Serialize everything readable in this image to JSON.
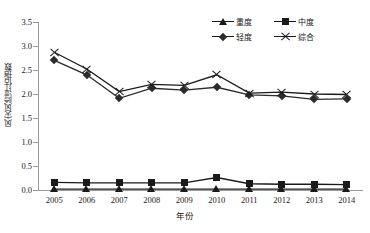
{
  "chart_data": {
    "type": "line",
    "title": "",
    "xlabel": "年份",
    "ylabel": "风灾风险评估指数",
    "categories": [
      "2005",
      "2006",
      "2007",
      "2008",
      "2009",
      "2010",
      "2011",
      "2012",
      "2013",
      "2014"
    ],
    "ylim": [
      0.0,
      3.5
    ],
    "ytick_labels": [
      "0.0",
      "0.5",
      "1.0",
      "1.5",
      "2.0",
      "2.5",
      "3.0",
      "3.5"
    ],
    "ytick_values": [
      0.0,
      0.5,
      1.0,
      1.5,
      2.0,
      2.5,
      3.0,
      3.5
    ],
    "grid": false,
    "legend_position": "top-right",
    "series": [
      {
        "name": "重度",
        "marker": "triangle",
        "color": "#1a1a1a",
        "values": [
          0.02,
          0.02,
          0.02,
          0.02,
          0.02,
          0.02,
          0.02,
          0.02,
          0.02,
          0.02
        ]
      },
      {
        "name": "中度",
        "marker": "square",
        "color": "#1a1a1a",
        "values": [
          0.16,
          0.15,
          0.15,
          0.15,
          0.15,
          0.26,
          0.13,
          0.12,
          0.12,
          0.11
        ]
      },
      {
        "name": "轻度",
        "marker": "diamond",
        "color": "#2b2b2b",
        "values": [
          2.7,
          2.4,
          1.91,
          2.12,
          2.08,
          2.14,
          1.98,
          1.96,
          1.89,
          1.9
        ]
      },
      {
        "name": "综合",
        "marker": "cross",
        "color": "#1a1a1a",
        "values": [
          2.87,
          2.52,
          2.05,
          2.2,
          2.18,
          2.4,
          2.02,
          2.04,
          2.0,
          1.99
        ]
      }
    ]
  },
  "legend": {
    "items": [
      {
        "label": "重度",
        "marker": "triangle"
      },
      {
        "label": "中度",
        "marker": "square"
      },
      {
        "label": "轻度",
        "marker": "diamond"
      },
      {
        "label": "综合",
        "marker": "cross"
      }
    ]
  },
  "axes": {
    "x_title": "年份",
    "y_title": "风灾风险评估指数"
  }
}
